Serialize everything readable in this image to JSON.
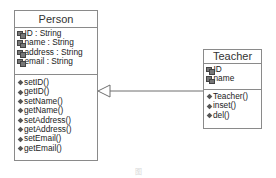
{
  "diagram": {
    "type": "uml-class-diagram",
    "classes": [
      {
        "id": "person",
        "name": "Person",
        "attributes": [
          "ID : String",
          "name : String",
          "address : String",
          "email : String"
        ],
        "methods": [
          "setID()",
          "getID()",
          "setName()",
          "getName()",
          "setAddress()",
          "getAddress()",
          "setEmail()",
          "getEmail()"
        ]
      },
      {
        "id": "teacher",
        "name": "Teacher",
        "attributes": [
          "ID",
          "name"
        ],
        "methods": [
          "Teacher()",
          "inset()",
          "del()"
        ]
      }
    ],
    "relationships": [
      {
        "type": "generalization",
        "from": "Teacher",
        "to": "Person",
        "arrow": "hollow-triangle"
      }
    ],
    "icons": {
      "attribute": "attribute-icon",
      "method": "method-icon"
    },
    "colors": {
      "border": "#8a8a8a",
      "line": "#6f6f6f",
      "text": "#222222"
    },
    "caption": "图"
  }
}
